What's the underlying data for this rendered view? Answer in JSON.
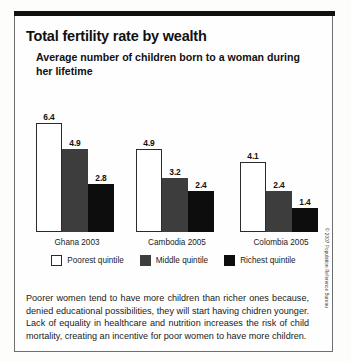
{
  "title": "Total fertility rate by wealth",
  "subtitle": "Average number of children born to a woman during her lifetime",
  "caption": "Poorer women tend to have more children than richer ones because, denied educational possibilities, they will start having chidren younger. Lack of equality in healthcare and nutrition increases the risk of child mortality, creating an incentive for poor women to have more children.",
  "credit": "© 2007 Population Reference Bureau",
  "legend": {
    "items": [
      {
        "label": "Poorest quintile",
        "color": "#ffffff"
      },
      {
        "label": "Middle quintile",
        "color": "#3d3d3d"
      },
      {
        "label": "Richest quintile",
        "color": "#0d0d0d"
      }
    ]
  },
  "chart_data": {
    "type": "bar",
    "title": "Total fertility rate by wealth",
    "subtitle": "Average number of children born to a woman during her lifetime",
    "categories": [
      "Ghana 2003",
      "Cambodia 2005",
      "Colombia 2005"
    ],
    "series": [
      {
        "name": "Poorest quintile",
        "values": [
          6.4,
          4.9,
          4.1
        ],
        "color": "#ffffff"
      },
      {
        "name": "Middle quintile",
        "values": [
          4.9,
          3.2,
          2.4
        ],
        "color": "#3d3d3d"
      },
      {
        "name": "Richest quintile",
        "values": [
          2.8,
          2.4,
          1.4
        ],
        "color": "#0d0d0d"
      }
    ],
    "xlabel": "",
    "ylabel": "Children per woman",
    "ylim": [
      0,
      6.4
    ],
    "grid": false,
    "axis_visible": false,
    "legend_position": "bottom",
    "data_labels": true,
    "groups": [
      {
        "label": "Ghana 2003",
        "bars": [
          {
            "series": "Poorest quintile",
            "value": 6.4,
            "value_label": "6.4",
            "color": "#ffffff"
          },
          {
            "series": "Middle quintile",
            "value": 4.9,
            "value_label": "4.9",
            "color": "#3d3d3d"
          },
          {
            "series": "Richest quintile",
            "value": 2.8,
            "value_label": "2.8",
            "color": "#0d0d0d"
          }
        ]
      },
      {
        "label": "Cambodia 2005",
        "bars": [
          {
            "series": "Poorest quintile",
            "value": 4.9,
            "value_label": "4.9",
            "color": "#ffffff"
          },
          {
            "series": "Middle quintile",
            "value": 3.2,
            "value_label": "3.2",
            "color": "#3d3d3d"
          },
          {
            "series": "Richest quintile",
            "value": 2.4,
            "value_label": "2.4",
            "color": "#0d0d0d"
          }
        ]
      },
      {
        "label": "Colombia 2005",
        "bars": [
          {
            "series": "Poorest quintile",
            "value": 4.1,
            "value_label": "4.1",
            "color": "#ffffff"
          },
          {
            "series": "Middle quintile",
            "value": 2.4,
            "value_label": "2.4",
            "color": "#3d3d3d"
          },
          {
            "series": "Richest quintile",
            "value": 1.4,
            "value_label": "1.4",
            "color": "#0d0d0d"
          }
        ]
      }
    ]
  }
}
